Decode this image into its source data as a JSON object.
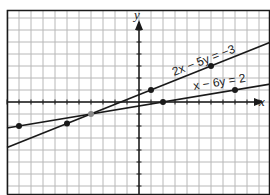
{
  "chart_data": {
    "type": "line",
    "title": "",
    "xlabel": "x",
    "ylabel": "y",
    "xlim": [
      -11,
      11
    ],
    "ylim": [
      -8,
      8
    ],
    "grid": true,
    "grid_step": 1,
    "series": [
      {
        "name": "2x - 5y = -3",
        "equation": "2x − 5y = −3",
        "slope": 0.4,
        "intercept": 0.6,
        "points": [
          [
            -6,
            -1.8
          ],
          [
            1,
            1
          ],
          [
            6,
            3
          ]
        ]
      },
      {
        "name": "x - 6y = 2",
        "equation": "x − 6y = 2",
        "slope": 0.1667,
        "intercept": -0.3333,
        "points": [
          [
            -10,
            -2
          ],
          [
            2,
            0
          ],
          [
            8,
            1
          ]
        ]
      }
    ],
    "intersection": [
      -4,
      -1
    ]
  },
  "labels": {
    "x_axis": "x",
    "y_axis": "y",
    "line1": "2x − 5y = −3",
    "line2": "x − 6y = 2"
  },
  "colors": {
    "grid": "#b8b8b8",
    "axis": "#1a1a1a",
    "line": "#1a1a1a",
    "intersection": "#8a8a8a"
  }
}
